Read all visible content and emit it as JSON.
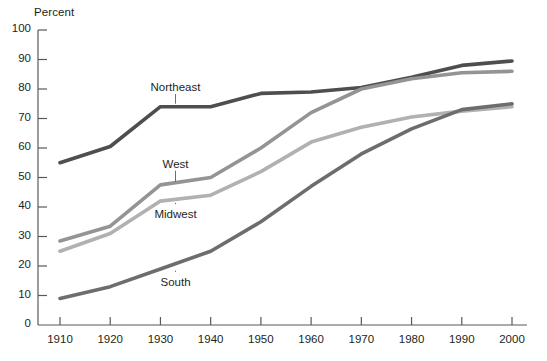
{
  "chart_data": {
    "type": "line",
    "title": "",
    "subtitle": "",
    "xlabel": "",
    "ylabel": "Percent",
    "ylim": [
      0,
      100
    ],
    "xlim": [
      1910,
      2000
    ],
    "grid": false,
    "legend_position": "inline-labels",
    "x": [
      1910,
      1920,
      1930,
      1940,
      1950,
      1960,
      1970,
      1980,
      1990,
      2000
    ],
    "x_tick_labels": [
      "1910",
      "1920",
      "1930",
      "1940",
      "1950",
      "1960",
      "1970",
      "1980",
      "1990",
      "2000"
    ],
    "y_tick_labels": [
      "0",
      "10",
      "20",
      "30",
      "40",
      "50",
      "60",
      "70",
      "80",
      "90",
      "100"
    ],
    "y_ticks": [
      0,
      10,
      20,
      30,
      40,
      50,
      60,
      70,
      80,
      90,
      100
    ],
    "series": [
      {
        "name": "Northeast",
        "color": "#4e4e4e",
        "values": [
          55,
          60.5,
          74,
          74,
          78.5,
          79,
          80.5,
          84,
          88,
          89.5
        ],
        "label": "Northeast",
        "label_x": 1933,
        "label_y": 80,
        "leader_to_y": 74
      },
      {
        "name": "West",
        "color": "#949494",
        "values": [
          28.5,
          33.5,
          47.5,
          50,
          60,
          72,
          80,
          83.5,
          85.5,
          86
        ],
        "label": "West",
        "label_x": 1933,
        "label_y": 54,
        "leader_to_y": 47.5
      },
      {
        "name": "Midwest",
        "color": "#b1b1b1",
        "values": [
          25,
          31,
          42,
          44,
          52,
          62,
          67,
          70.5,
          72.5,
          74
        ],
        "label": "Midwest",
        "label_x": 1933,
        "label_y": 37,
        "leader_to_y": 42
      },
      {
        "name": "South",
        "color": "#6d6d6d",
        "values": [
          9,
          13,
          19,
          25,
          35,
          47,
          58,
          66.5,
          73,
          75
        ],
        "label": "South",
        "label_x": 1933,
        "label_y": 14,
        "leader_to_y": 19
      }
    ]
  },
  "axis": {
    "y_title": "Percent",
    "axis_color": "#58595b"
  }
}
